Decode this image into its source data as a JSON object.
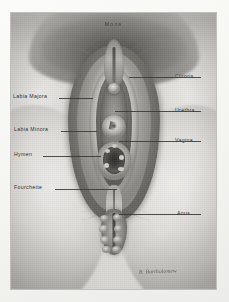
{
  "plate": {
    "medium": "grayscale halftone anatomical illustration on paper mount",
    "title_label": "Mons",
    "signature": "B. Bartholomew"
  },
  "labels": {
    "left": [
      {
        "text": "Labia Majora",
        "name": "label-labia-majora"
      },
      {
        "text": "Labia Minora",
        "name": "label-labia-minora"
      },
      {
        "text": "Hymen",
        "name": "label-hymen"
      },
      {
        "text": "Fourchette",
        "name": "label-fourchette"
      }
    ],
    "right": [
      {
        "text": "Clitoris",
        "name": "label-clitoris"
      },
      {
        "text": "Urethra",
        "name": "label-urethra"
      },
      {
        "text": "Vagina",
        "name": "label-vagina"
      },
      {
        "text": "Anus",
        "name": "label-anus"
      }
    ]
  },
  "colors": {
    "paper": "#fbfbf9",
    "plate_mid": "#d9d8d6",
    "shadow_dark": "#6f6e6b",
    "highlight": "#efeeec",
    "ink": "#2b2a28"
  }
}
